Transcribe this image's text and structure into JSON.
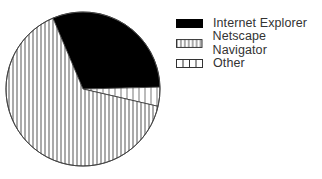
{
  "chart_data": {
    "type": "pie",
    "title": "",
    "categories": [
      "Internet Explorer",
      "Netscape Navigator",
      "Other"
    ],
    "values": [
      31,
      65,
      4
    ],
    "unit": "%",
    "start_angle_deg": -23,
    "direction": "clockwise",
    "fills": [
      "solid-black",
      "vertical-stripes-dense",
      "vertical-stripes-sparse"
    ],
    "legend_position": "right",
    "colors": {
      "ink": "#000000",
      "stripe": "#555555",
      "background": "#ffffff"
    }
  },
  "legend": {
    "items": [
      {
        "label": "Internet Explorer",
        "fill": "solid-black"
      },
      {
        "label": "Netscape Navigator",
        "fill": "vertical-stripes-dense"
      },
      {
        "label": "Other",
        "fill": "vertical-stripes-sparse"
      }
    ]
  }
}
